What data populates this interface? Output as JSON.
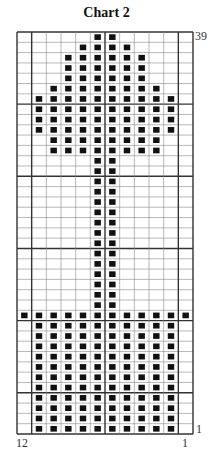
{
  "title": "Chart 2",
  "labels": {
    "top_row": "39",
    "bottom_row": "1",
    "left_col": "12",
    "right_col": "1"
  },
  "colors": {
    "filled": "#111111",
    "grid_line": "#888888",
    "major_line": "#333333",
    "background": "#ffffff"
  },
  "chart_data": {
    "type": "table",
    "columns": 12,
    "rows_count": 39,
    "major_line_every_rows_from_top": 7,
    "major_vertical_after_left_cols": [
      1,
      6,
      11
    ],
    "rows": [
      [
        0,
        0,
        0,
        0,
        0,
        1,
        1,
        0,
        0,
        0,
        0,
        0
      ],
      [
        0,
        0,
        0,
        0,
        1,
        1,
        1,
        1,
        0,
        0,
        0,
        0
      ],
      [
        0,
        0,
        0,
        1,
        1,
        1,
        1,
        1,
        1,
        0,
        0,
        0
      ],
      [
        0,
        0,
        0,
        1,
        1,
        1,
        1,
        1,
        1,
        0,
        0,
        0
      ],
      [
        0,
        0,
        0,
        1,
        1,
        1,
        1,
        1,
        1,
        0,
        0,
        0
      ],
      [
        0,
        0,
        1,
        1,
        1,
        1,
        1,
        1,
        1,
        1,
        0,
        0
      ],
      [
        0,
        1,
        1,
        1,
        1,
        1,
        1,
        1,
        1,
        1,
        1,
        0
      ],
      [
        0,
        1,
        1,
        1,
        1,
        1,
        1,
        1,
        1,
        1,
        1,
        0
      ],
      [
        0,
        1,
        1,
        1,
        1,
        1,
        1,
        1,
        1,
        1,
        1,
        0
      ],
      [
        0,
        1,
        1,
        1,
        1,
        1,
        1,
        1,
        1,
        1,
        1,
        0
      ],
      [
        0,
        0,
        1,
        1,
        1,
        1,
        1,
        1,
        1,
        1,
        0,
        0
      ],
      [
        0,
        0,
        1,
        1,
        1,
        1,
        1,
        1,
        1,
        1,
        0,
        0
      ],
      [
        0,
        0,
        0,
        0,
        0,
        1,
        1,
        0,
        0,
        0,
        0,
        0
      ],
      [
        0,
        0,
        0,
        0,
        0,
        1,
        1,
        0,
        0,
        0,
        0,
        0
      ],
      [
        0,
        0,
        0,
        0,
        0,
        1,
        1,
        0,
        0,
        0,
        0,
        0
      ],
      [
        0,
        0,
        0,
        0,
        0,
        1,
        1,
        0,
        0,
        0,
        0,
        0
      ],
      [
        0,
        0,
        0,
        0,
        0,
        1,
        1,
        0,
        0,
        0,
        0,
        0
      ],
      [
        0,
        0,
        0,
        0,
        0,
        1,
        1,
        0,
        0,
        0,
        0,
        0
      ],
      [
        0,
        0,
        0,
        0,
        0,
        1,
        1,
        0,
        0,
        0,
        0,
        0
      ],
      [
        0,
        0,
        0,
        0,
        0,
        1,
        1,
        0,
        0,
        0,
        0,
        0
      ],
      [
        0,
        0,
        0,
        0,
        0,
        1,
        1,
        0,
        0,
        0,
        0,
        0
      ],
      [
        0,
        0,
        0,
        0,
        0,
        1,
        1,
        0,
        0,
        0,
        0,
        0
      ],
      [
        0,
        0,
        0,
        0,
        0,
        1,
        1,
        0,
        0,
        0,
        0,
        0
      ],
      [
        0,
        0,
        0,
        0,
        0,
        1,
        1,
        0,
        0,
        0,
        0,
        0
      ],
      [
        0,
        0,
        0,
        0,
        0,
        1,
        1,
        0,
        0,
        0,
        0,
        0
      ],
      [
        0,
        0,
        0,
        0,
        0,
        1,
        1,
        0,
        0,
        0,
        0,
        0
      ],
      [
        0,
        0,
        0,
        0,
        0,
        1,
        1,
        0,
        0,
        0,
        0,
        0
      ],
      [
        1,
        1,
        1,
        1,
        1,
        1,
        1,
        1,
        1,
        1,
        1,
        1
      ],
      [
        0,
        1,
        1,
        1,
        1,
        1,
        1,
        1,
        1,
        1,
        1,
        0
      ],
      [
        0,
        1,
        1,
        1,
        1,
        1,
        1,
        1,
        1,
        1,
        1,
        0
      ],
      [
        0,
        1,
        1,
        1,
        1,
        1,
        1,
        1,
        1,
        1,
        1,
        0
      ],
      [
        0,
        1,
        1,
        1,
        1,
        1,
        1,
        1,
        1,
        1,
        1,
        0
      ],
      [
        0,
        1,
        1,
        1,
        1,
        1,
        1,
        1,
        1,
        1,
        1,
        0
      ],
      [
        0,
        1,
        1,
        1,
        1,
        1,
        1,
        1,
        1,
        1,
        1,
        0
      ],
      [
        0,
        1,
        1,
        1,
        1,
        1,
        1,
        1,
        1,
        1,
        1,
        0
      ],
      [
        0,
        1,
        1,
        1,
        1,
        1,
        1,
        1,
        1,
        1,
        1,
        0
      ],
      [
        0,
        1,
        1,
        1,
        1,
        1,
        1,
        1,
        1,
        1,
        1,
        0
      ],
      [
        0,
        1,
        1,
        1,
        1,
        1,
        1,
        1,
        1,
        1,
        1,
        0
      ],
      [
        0,
        1,
        1,
        1,
        1,
        1,
        1,
        1,
        1,
        1,
        1,
        0
      ]
    ]
  }
}
